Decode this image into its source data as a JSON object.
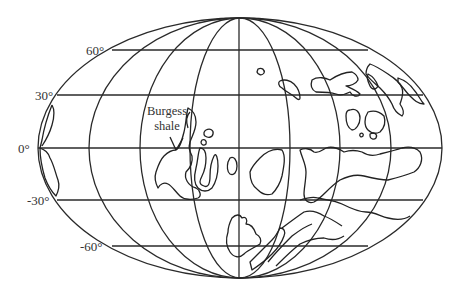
{
  "map": {
    "projection": "mollweide-like equal-area world map",
    "latitude_labels": [
      {
        "key": "lat60",
        "text": "60°"
      },
      {
        "key": "lat30",
        "text": "30°"
      },
      {
        "key": "lat0",
        "text": "0°"
      },
      {
        "key": "latm30",
        "text": "-30°"
      },
      {
        "key": "latm60",
        "text": "-60°"
      }
    ],
    "labels": {
      "lat60": "60°",
      "lat30": "30°",
      "lat0": "0°",
      "latm30": "-30°",
      "latm60": "-60°"
    },
    "annotation": {
      "line1": "Burgess",
      "line2": "shale"
    },
    "colors": {
      "line": "#222222",
      "background": "#ffffff"
    }
  }
}
